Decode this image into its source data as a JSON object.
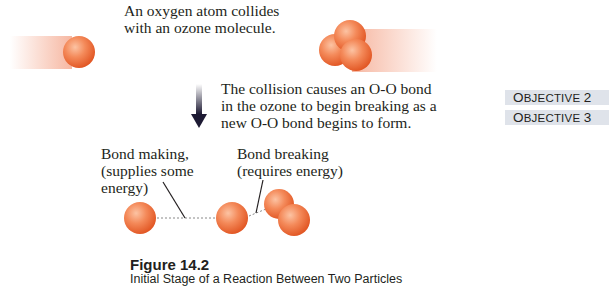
{
  "diagram": {
    "step1_text_line1": "An oxygen atom collides",
    "step1_text_line2": "with an ozone molecule.",
    "step2_text_line1": "The collision causes an O-O bond",
    "step2_text_line2": "in the ozone to begin breaking as a",
    "step2_text_line3": "new O-O bond begins to form.",
    "label_making_line1": "Bond making,",
    "label_making_line2": "(supplies some",
    "label_making_line3": "energy)",
    "label_breaking_line1": "Bond breaking",
    "label_breaking_line2": "(requires energy)"
  },
  "objectives": [
    {
      "prefix": "O",
      "rest": "BJECTIVE",
      "number": "2"
    },
    {
      "prefix": "O",
      "rest": "BJECTIVE",
      "number": "3"
    }
  ],
  "figure": {
    "title": "Figure 14.2",
    "caption": "Initial Stage of a Reaction Between Two Particles"
  },
  "colors": {
    "atom": "#f06a3a",
    "atom_highlight": "#fbb894",
    "trail": "#f4a58a",
    "arrow": "#1d1a33",
    "objective_bg": "#dfe3ea"
  }
}
